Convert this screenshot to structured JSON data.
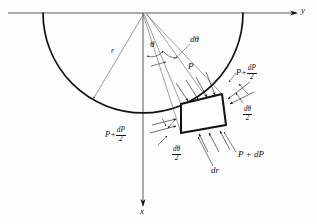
{
  "figure": {
    "background_color": "#fdfdfd",
    "line_color": "#111111",
    "axes": {
      "horizontal_label": "y",
      "vertical_label": "x",
      "origin": {
        "x": 143,
        "y": 13
      }
    },
    "arc": {
      "center_x": 143,
      "center_y": 13,
      "radius": 100,
      "start_label": "left-end-of-arc",
      "end_label": "right-end-of-arc"
    },
    "labels": {
      "radius": "r",
      "theta": "θ",
      "d_theta": "dθ",
      "pressure": "P",
      "pressure_full": {
        "base": "P",
        "operator": "+",
        "delta": "dP"
      },
      "pressure_half_num": "dP",
      "pressure_half_den": "2",
      "d_theta_half_num": "dθ",
      "d_theta_half_den": "2",
      "dr": "dr"
    },
    "annotations": [
      {
        "id": "axis-y",
        "text": "y",
        "x": 300,
        "y": 8,
        "size": "ax"
      },
      {
        "id": "axis-x",
        "text": "x",
        "x": 141,
        "y": 209,
        "size": "ax"
      },
      {
        "id": "radius-r",
        "text": "r",
        "x": 112,
        "y": 50,
        "size": "sm"
      },
      {
        "id": "angle-theta",
        "text": "θ",
        "x": 152,
        "y": 45,
        "size": "md"
      },
      {
        "id": "angle-dtheta",
        "text": "dθ",
        "x": 191,
        "y": 40,
        "size": "md"
      },
      {
        "id": "pressure-P",
        "text": "P",
        "x": 188,
        "y": 67,
        "size": "md"
      },
      {
        "id": "pressure-P-dP",
        "text": "P + dP",
        "x": 239,
        "y": 155,
        "size": "md"
      },
      {
        "id": "element-dr",
        "text": "dr",
        "x": 213,
        "y": 170,
        "size": "md"
      }
    ],
    "force_arrows": [
      {
        "id": "P-top-left",
        "label": "P"
      },
      {
        "id": "P-dP-half-right",
        "label": "P + dP/2"
      },
      {
        "id": "P-dP-half-left",
        "label": "P + dP/2"
      },
      {
        "id": "P-dP-bottom",
        "label": "P + dP"
      }
    ],
    "angle_marks": [
      {
        "id": "dtheta-half-right",
        "label": "dθ/2"
      },
      {
        "id": "dtheta-half-left",
        "label": "dθ/2"
      }
    ],
    "element": {
      "name": "differential-element",
      "corners": [
        {
          "x": 181,
          "y": 104
        },
        {
          "x": 222,
          "y": 94
        },
        {
          "x": 226,
          "y": 125
        },
        {
          "x": 181,
          "y": 133
        }
      ]
    }
  }
}
